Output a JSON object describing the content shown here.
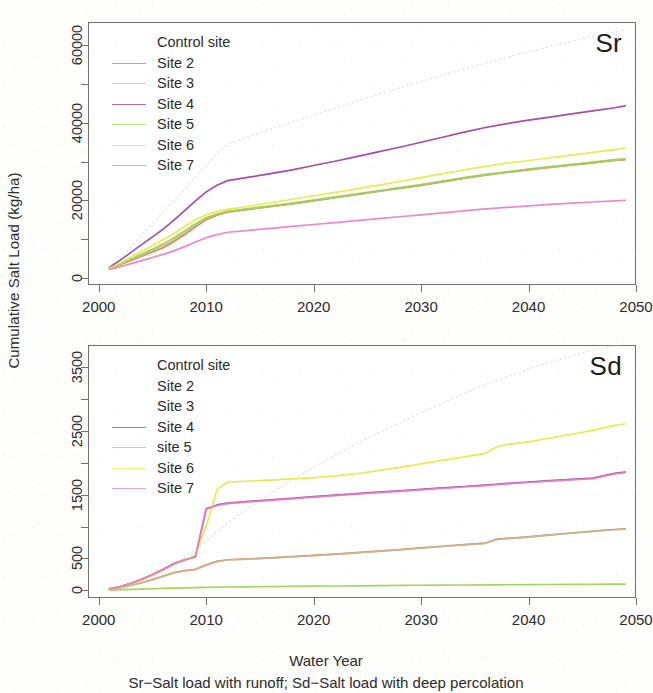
{
  "figure": {
    "y_axis_title": "Cumulative Salt Load (kg/ha)",
    "x_axis_title": "Water Year",
    "caption": "Sr−Salt load with runoff; Sd−Salt load with deep percolation"
  },
  "colors": {
    "control": "#c9c4bb",
    "site2": "#d4803a",
    "site3": "#c8b79a",
    "site4": "#9b3fa0",
    "site5": "#9bd44e",
    "site6": "#e8e840",
    "site7": "#e87fc8",
    "frame": "#6f6f6f",
    "text": "#2b2b2b"
  },
  "chart_data": [
    {
      "type": "line",
      "panel": "top",
      "title": "Sr",
      "corner_label": "Sr",
      "xlabel": "Water Year",
      "ylabel": "Cumulative Salt Load (kg/ha)",
      "xlim": [
        1999,
        2050
      ],
      "ylim": [
        -1800,
        66000
      ],
      "xticks": [
        2000,
        2010,
        2020,
        2030,
        2040,
        2050
      ],
      "xtick_labels": [
        "2000",
        "2010",
        "2020",
        "2030",
        "2040",
        "2050"
      ],
      "yticks": [
        0,
        20000,
        40000,
        60000
      ],
      "ytick_labels": [
        "0",
        "20000",
        "40000",
        "60000"
      ],
      "yticks_minor": [
        10000,
        30000,
        50000
      ],
      "grid": false,
      "legend_position": "top-left",
      "legend": [
        {
          "label": "Control site",
          "color": "#c9c4bb",
          "style": "none"
        },
        {
          "label": "Site 2",
          "color": "#d4803a",
          "style": "solid"
        },
        {
          "label": "Site 3",
          "color": "#c8b79a",
          "style": "solid"
        },
        {
          "label": "Site 4",
          "color": "#9b3fa0",
          "style": "solid"
        },
        {
          "label": "Site 5",
          "color": "#9bd44e",
          "style": "solid"
        },
        {
          "label": "Site 6",
          "color": "#e8e840",
          "style": "solid"
        },
        {
          "label": "Site 7",
          "color": "#e87fc8",
          "style": "solid"
        }
      ],
      "x": [
        2001,
        2002,
        2003,
        2004,
        2005,
        2006,
        2007,
        2008,
        2009,
        2010,
        2011,
        2012,
        2014,
        2016,
        2018,
        2020,
        2022,
        2024,
        2026,
        2028,
        2030,
        2032,
        2034,
        2036,
        2038,
        2040,
        2042,
        2044,
        2046,
        2048,
        2049
      ],
      "series": [
        {
          "name": "Control site",
          "color": "#c9c4bb",
          "style": "dotted",
          "values": [
            2600,
            5200,
            8000,
            11000,
            14000,
            17000,
            20000,
            23000,
            26000,
            29000,
            32000,
            34500,
            36500,
            38400,
            40200,
            42000,
            43800,
            45600,
            47300,
            49000,
            50700,
            52300,
            53900,
            55400,
            56900,
            58300,
            59700,
            61000,
            62300,
            63500,
            64000
          ]
        },
        {
          "name": "Site 2",
          "color": "#d4803a",
          "style": "solid",
          "values": [
            2400,
            3400,
            4500,
            5600,
            6700,
            7800,
            9400,
            11200,
            13200,
            15000,
            16200,
            17000,
            17700,
            18400,
            19100,
            19900,
            20700,
            21500,
            22300,
            23100,
            23900,
            24800,
            25700,
            26500,
            27200,
            27900,
            28500,
            29100,
            29700,
            30300,
            30500
          ]
        },
        {
          "name": "Site 3",
          "color": "#c8b79a",
          "style": "solid",
          "values": [
            2400,
            3500,
            4700,
            5900,
            7100,
            8300,
            9900,
            11700,
            13600,
            15300,
            16400,
            17100,
            17800,
            18500,
            19200,
            20000,
            20800,
            21600,
            22400,
            23200,
            24000,
            24900,
            25800,
            26600,
            27300,
            28000,
            28600,
            29200,
            29800,
            30400,
            30600
          ]
        },
        {
          "name": "Site 4",
          "color": "#9b3fa0",
          "style": "solid",
          "values": [
            2700,
            4600,
            6600,
            8600,
            10600,
            12600,
            14900,
            17400,
            19900,
            22200,
            23900,
            25100,
            26000,
            26900,
            27900,
            29000,
            30100,
            31300,
            32500,
            33700,
            35000,
            36300,
            37600,
            38800,
            39800,
            40700,
            41500,
            42300,
            43100,
            43900,
            44400
          ]
        },
        {
          "name": "Site 5",
          "color": "#9bd44e",
          "style": "solid",
          "values": [
            2400,
            3600,
            4900,
            6200,
            7500,
            8800,
            10400,
            12200,
            14000,
            15600,
            16500,
            17200,
            17900,
            18600,
            19300,
            20100,
            20900,
            21700,
            22500,
            23300,
            24100,
            25000,
            25900,
            26700,
            27400,
            28100,
            28700,
            29300,
            29900,
            30500,
            30700
          ]
        },
        {
          "name": "Site 6",
          "color": "#e8e840",
          "style": "solid",
          "values": [
            2500,
            3900,
            5400,
            6900,
            8400,
            9900,
            11500,
            13300,
            15000,
            16300,
            17100,
            17700,
            18500,
            19400,
            20300,
            21200,
            22100,
            23000,
            23900,
            24900,
            25900,
            26900,
            27900,
            28800,
            29600,
            30300,
            31000,
            31700,
            32400,
            33100,
            33500
          ]
        },
        {
          "name": "Site 7",
          "color": "#e87fc8",
          "style": "solid",
          "values": [
            2200,
            2900,
            3700,
            4500,
            5300,
            6100,
            7000,
            8100,
            9300,
            10400,
            11200,
            11800,
            12300,
            12800,
            13300,
            13800,
            14300,
            14800,
            15300,
            15800,
            16300,
            16800,
            17300,
            17800,
            18200,
            18600,
            19000,
            19300,
            19600,
            19900,
            20000
          ]
        }
      ]
    },
    {
      "type": "line",
      "panel": "bottom",
      "title": "Sd",
      "corner_label": "Sd",
      "xlabel": "Water Year",
      "ylabel": "Cumulative Salt Load (kg/ha)",
      "xlim": [
        1999,
        2050
      ],
      "ylim": [
        -120,
        3850
      ],
      "xticks": [
        2000,
        2010,
        2020,
        2030,
        2040,
        2050
      ],
      "xtick_labels": [
        "2000",
        "2010",
        "2020",
        "2030",
        "2040",
        "2050"
      ],
      "yticks": [
        0,
        500,
        1500,
        2500,
        3500
      ],
      "ytick_labels": [
        "0",
        "500",
        "1500",
        "2500",
        "3500"
      ],
      "yticks_minor": [
        1000,
        2000,
        3000
      ],
      "grid": false,
      "legend_position": "top-left",
      "legend": [
        {
          "label": "Control site",
          "color": "#c9c4bb",
          "style": "none"
        },
        {
          "label": "Site 2",
          "color": "#d4803a",
          "style": "none"
        },
        {
          "label": "Site 3",
          "color": "#c8b79a",
          "style": "none"
        },
        {
          "label": "Site 4",
          "color": "#9b3fa0",
          "style": "solid"
        },
        {
          "label": "site 5",
          "color": "#9bd44e",
          "style": "solid"
        },
        {
          "label": "Site 6",
          "color": "#e8e840",
          "style": "solid"
        },
        {
          "label": "Site 7",
          "color": "#e87fc8",
          "style": "solid"
        }
      ],
      "x": [
        2001,
        2002,
        2003,
        2004,
        2005,
        2006,
        2007,
        2008,
        2009,
        2010,
        2011,
        2012,
        2014,
        2016,
        2018,
        2020,
        2022,
        2024,
        2026,
        2028,
        2030,
        2032,
        2034,
        2036,
        2037,
        2038,
        2040,
        2042,
        2044,
        2046,
        2048,
        2049
      ],
      "series": [
        {
          "name": "Control site",
          "color": "#c9c4bb",
          "style": "dotted",
          "values": [
            30,
            70,
            120,
            180,
            250,
            330,
            420,
            520,
            640,
            780,
            920,
            1060,
            1300,
            1520,
            1730,
            1930,
            2120,
            2300,
            2470,
            2630,
            2790,
            2940,
            3090,
            3230,
            3290,
            3350,
            3470,
            3580,
            3680,
            3770,
            3840,
            3860
          ]
        },
        {
          "name": "Site 2",
          "color": "#d4803a",
          "style": "solid",
          "values": [
            20,
            45,
            80,
            120,
            170,
            225,
            280,
            310,
            330,
            400,
            455,
            480,
            495,
            510,
            528,
            548,
            570,
            592,
            615,
            640,
            665,
            692,
            718,
            742,
            800,
            815,
            840,
            870,
            900,
            930,
            955,
            965
          ]
        },
        {
          "name": "Site 3",
          "color": "#c8b79a",
          "style": "solid",
          "values": [
            18,
            42,
            76,
            116,
            165,
            220,
            275,
            305,
            325,
            395,
            450,
            476,
            491,
            506,
            524,
            544,
            566,
            588,
            611,
            636,
            661,
            688,
            714,
            738,
            796,
            811,
            836,
            866,
            896,
            926,
            951,
            961
          ]
        },
        {
          "name": "Site 4",
          "color": "#9b3fa0",
          "style": "solid",
          "values": [
            25,
            60,
            110,
            175,
            250,
            330,
            420,
            480,
            530,
            1280,
            1340,
            1370,
            1395,
            1420,
            1445,
            1470,
            1495,
            1518,
            1540,
            1562,
            1585,
            1608,
            1630,
            1652,
            1665,
            1678,
            1700,
            1722,
            1742,
            1762,
            1835,
            1855
          ]
        },
        {
          "name": "site 5",
          "color": "#9bd44e",
          "style": "solid",
          "values": [
            5,
            10,
            15,
            20,
            25,
            30,
            34,
            38,
            42,
            46,
            50,
            53,
            56,
            59,
            62,
            65,
            68,
            71,
            74,
            77,
            80,
            82,
            84,
            86,
            87,
            88,
            90,
            92,
            94,
            96,
            98,
            99
          ]
        },
        {
          "name": "Site 6",
          "color": "#e8e840",
          "style": "solid",
          "values": [
            22,
            55,
            100,
            160,
            235,
            315,
            405,
            470,
            560,
            1000,
            1580,
            1700,
            1715,
            1730,
            1748,
            1770,
            1795,
            1830,
            1880,
            1930,
            1985,
            2040,
            2095,
            2150,
            2250,
            2290,
            2330,
            2390,
            2450,
            2510,
            2590,
            2610
          ]
        },
        {
          "name": "Site 7",
          "color": "#e87fc8",
          "style": "solid",
          "values": [
            24,
            58,
            107,
            170,
            244,
            324,
            414,
            474,
            524,
            1272,
            1332,
            1362,
            1387,
            1412,
            1437,
            1462,
            1487,
            1510,
            1532,
            1554,
            1577,
            1600,
            1622,
            1644,
            1657,
            1670,
            1692,
            1714,
            1734,
            1754,
            1827,
            1847
          ]
        }
      ]
    }
  ]
}
